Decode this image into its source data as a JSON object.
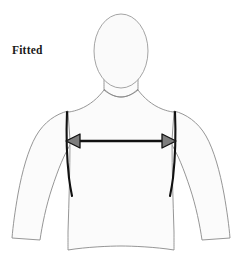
{
  "diagram": {
    "caption": "Fitted",
    "measurement": {
      "name": "chest-width",
      "arrow_style": "double-headed",
      "arrow_left_x": 66,
      "arrow_right_x": 176,
      "arrow_y": 141,
      "left_endpoint_label": "left armhole seam",
      "right_endpoint_label": "right armhole seam"
    },
    "colors": {
      "background": "#ffffff",
      "body_fill": "#fbfbfb",
      "body_outline": "#8a8a8a",
      "head_fill": "#fafafa",
      "head_outline": "#9a9a9a",
      "seam_line": "#111111",
      "arrow_line": "#111111",
      "arrow_head_fill": "#7d7d7d",
      "arrow_head_stroke": "#111111",
      "caption_text": "#1a1a1a"
    },
    "parts": {
      "head": "head-oval",
      "neck": "neck",
      "shoulders": "shoulder-line",
      "torso": "torso",
      "left_arm": "left-arm",
      "right_arm": "right-arm",
      "left_seam": "left-armhole-seam",
      "right_seam": "right-armhole-seam"
    }
  }
}
